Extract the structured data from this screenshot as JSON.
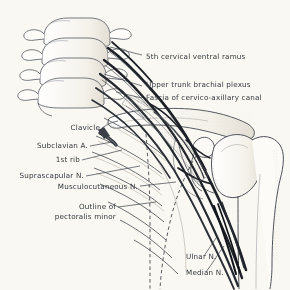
{
  "figure": {
    "background_color": "#faf8f2",
    "ink_color": "#33383f",
    "line_color": "#2b2f36",
    "shade_color": "#b9b5ac"
  },
  "labels": {
    "fifth_cervical_ventral_ramus": "5th cervical ventral ramus",
    "upper_trunk_brachial_plexus": "Upper trunk brachial plexus",
    "fascia_cervico_axillary_canal": "Fascia of cervico-axillary canal",
    "clavicle": "Clavicle",
    "subclavian_artery": "Subclavian A.",
    "first_rib": "1st rib",
    "suprascapular_nerve": "Suprascapular N.",
    "musculocutaneous_nerve": "Musculocutaneous N.",
    "outline_of_line1": "Outline of",
    "outline_of_line2": "pectoralis minor",
    "ulnar_nerve": "Ulnar N.",
    "median_nerve": "Median N."
  },
  "structures": {
    "cervical_vertebrae_count": 4,
    "ribs_count": 7,
    "bones": [
      "cervical vertebrae",
      "clavicle",
      "scapula",
      "coracoid process",
      "humerus",
      "ribs"
    ],
    "nerves": [
      "C5 ventral ramus",
      "upper trunk",
      "suprascapular nerve",
      "musculocutaneous nerve",
      "ulnar nerve",
      "median nerve"
    ],
    "vessels": [
      "subclavian artery"
    ],
    "soft_tissue": [
      "cervico-axillary canal fascia",
      "pectoralis minor outline"
    ]
  }
}
